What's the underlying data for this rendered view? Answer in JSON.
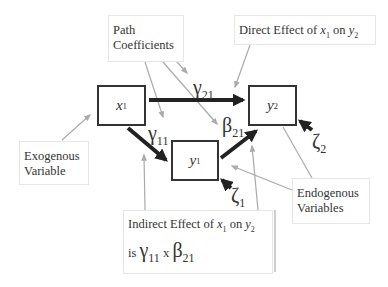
{
  "nodes": {
    "x1": {
      "base": "x",
      "sub": "1"
    },
    "y1": {
      "base": "y",
      "sub": "1"
    },
    "y2": {
      "base": "y",
      "sub": "2"
    }
  },
  "coefficients": {
    "gamma21": {
      "base": "γ",
      "sub": "21"
    },
    "gamma11": {
      "base": "γ",
      "sub": "11"
    },
    "beta21": {
      "base": "β",
      "sub": "21"
    },
    "zeta1": {
      "base": "ζ",
      "sub": "1"
    },
    "zeta2": {
      "base": "ζ",
      "sub": "2"
    }
  },
  "labels": {
    "path_coefficients": {
      "line1": "Path",
      "line2": "Coefficients"
    },
    "direct_effect": {
      "prefix": "Direct Effect of ",
      "x": "x",
      "x_sub": "1",
      "mid": " on ",
      "y": "y",
      "y_sub": "2"
    },
    "exogenous": {
      "line1": "Exogenous",
      "line2": "Variable"
    },
    "endogenous": {
      "line1": "Endogenous",
      "line2": "Variables"
    },
    "indirect_effect": {
      "prefix": "Indirect Effect of ",
      "x": "x",
      "x_sub": "1",
      "mid": " on ",
      "y": "y",
      "y_sub": "2",
      "is": "is ",
      "g": "γ",
      "g_sub": "11",
      "times": " x ",
      "b": "β",
      "b_sub": "21"
    }
  },
  "colors": {
    "line": "#333333",
    "pointer": "#aaaaaa"
  }
}
